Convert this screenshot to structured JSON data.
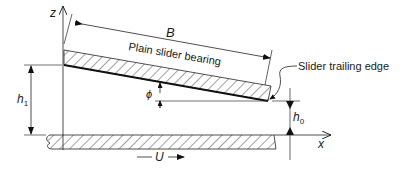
{
  "diagram": {
    "labels": {
      "slider": "Plain slider bearing",
      "trailing_edge": "Slider trailing edge",
      "length": "B",
      "z_axis": "z",
      "x_axis": "x",
      "inlet_film": "h",
      "inlet_film_sub": "1",
      "outlet_film": "h",
      "outlet_film_sub": "0",
      "angle": "ϕ",
      "velocity": "U"
    },
    "colors": {
      "line": "#1a1a1a",
      "hatch": "#333333",
      "background": "#ffffff"
    }
  }
}
